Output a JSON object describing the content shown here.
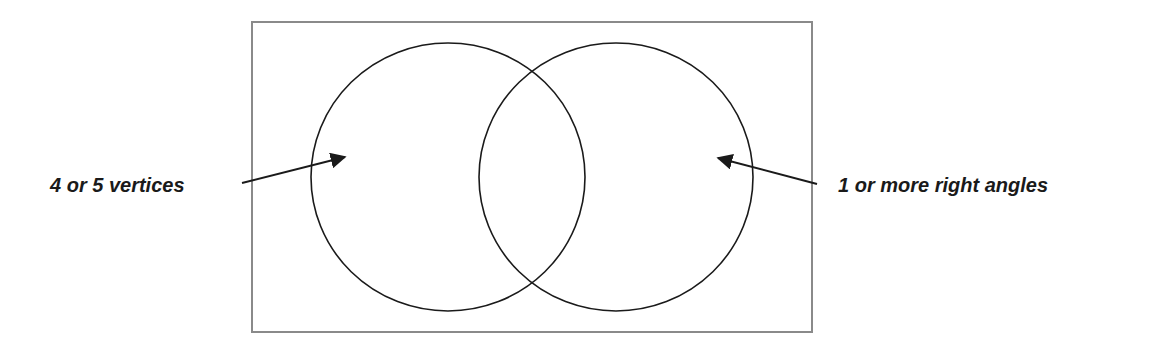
{
  "diagram": {
    "type": "venn",
    "sets": [
      {
        "label": "4 or 5 vertices"
      },
      {
        "label": "1 or more right angles"
      }
    ],
    "colors": {
      "stroke": "#1a1a1a",
      "frame": "#8a8a8a",
      "background": "#ffffff"
    }
  }
}
